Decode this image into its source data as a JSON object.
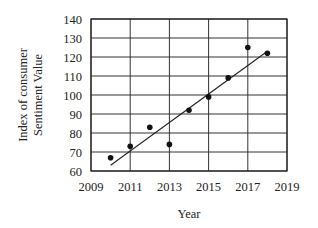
{
  "chart_data": {
    "type": "scatter",
    "title": "",
    "xlabel": "Year",
    "ylabel": "Index of consumer Sentiment Value",
    "ylabel_lines": [
      "Index of consumer",
      "Sentiment Value"
    ],
    "xlim": [
      2009,
      2019
    ],
    "ylim": [
      60,
      140
    ],
    "xticks": [
      2009,
      2011,
      2013,
      2015,
      2017,
      2019
    ],
    "yticks": [
      60,
      70,
      80,
      90,
      100,
      110,
      120,
      130,
      140
    ],
    "grid": true,
    "legend": null,
    "series": [
      {
        "name": "Index of consumer Sentiment Value",
        "type": "scatter",
        "x": [
          2010,
          2011,
          2012,
          2013,
          2014,
          2015,
          2016,
          2017,
          2018
        ],
        "y": [
          67,
          73,
          83,
          74,
          92,
          99,
          109,
          125,
          122
        ]
      },
      {
        "name": "Line of best fit",
        "type": "line",
        "x": [
          2010,
          2018
        ],
        "y": [
          63,
          123
        ]
      }
    ]
  }
}
